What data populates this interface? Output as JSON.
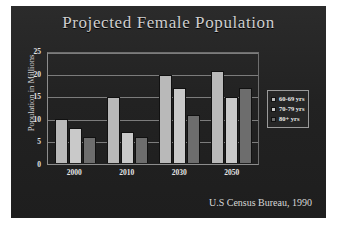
{
  "slide": {
    "title": "Projected Female Population",
    "source": "U.S Census Bureau, 1990",
    "page_caption": "",
    "background_color": "#232323",
    "title_color": "#cfcfcf"
  },
  "legend": {
    "position": "right",
    "items": [
      {
        "label": "60-69 yrs",
        "color": "#b9b9b9"
      },
      {
        "label": "70-79 yrs",
        "color": "#c9c9c9"
      },
      {
        "label": "80+ yrs",
        "color": "#6d6d6d"
      }
    ]
  },
  "chart_data": {
    "type": "bar",
    "title": "Projected Female Population",
    "subtitle": "",
    "xlabel": "",
    "ylabel": "Population in Millions",
    "categories": [
      "2000",
      "2010",
      "2030",
      "2050"
    ],
    "series": [
      {
        "name": "60-69 yrs",
        "color": "#b9b9b9",
        "values": [
          10,
          15,
          20,
          21
        ]
      },
      {
        "name": "70-79 yrs",
        "color": "#c9c9c9",
        "values": [
          8,
          7,
          17,
          15
        ]
      },
      {
        "name": "80+ yrs",
        "color": "#6d6d6d",
        "values": [
          6,
          6,
          11,
          17
        ]
      }
    ],
    "ylim": [
      0,
      25
    ],
    "yticks": [
      0,
      5,
      10,
      15,
      20,
      25
    ],
    "ytick_labels": [
      "0",
      "5",
      "10",
      "15",
      "20",
      "25"
    ],
    "grid": true,
    "grid_axis": "y",
    "legend_position": "right",
    "annotations": [
      "U.S Census Bureau, 1990"
    ]
  }
}
